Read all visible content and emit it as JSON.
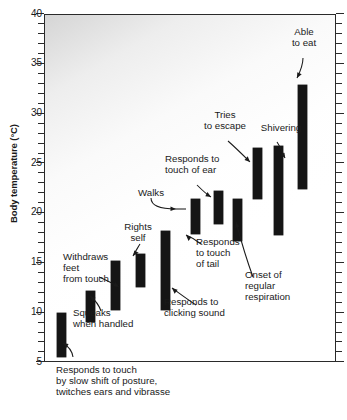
{
  "chart_data": {
    "type": "bar",
    "title": "",
    "xlabel": "",
    "ylabel": "Body temperature (°C)",
    "ylim": [
      3.5,
      40
    ],
    "yticks": [
      5,
      10,
      15,
      20,
      25,
      30,
      35,
      40
    ],
    "ytick_labels": [
      "5",
      "10",
      "15",
      "20",
      "25",
      "30",
      "35",
      "40"
    ],
    "minor_tick_step": 1,
    "grid": false,
    "legend": null,
    "orientation": "vertical",
    "bar_kind": "floating-range",
    "note": "Each black bar is a temperature range over which the behaviour occurs; bars ordered left to right by increasing temperature.",
    "categories": [
      "Responds to touch by slow shift of posture, twitches ears and vibrasse",
      "Squeaks when handled",
      "Withdraws feet from touch",
      "Rights self",
      "Responds to clicking sound",
      "Walks",
      "Responds to touch of ear",
      "Responds to touch of tail",
      "Tries to escape",
      "Onset of regular respiration",
      "Shivering",
      "Able to eat"
    ],
    "bars": [
      {
        "index": 1,
        "x_px": 56,
        "low": 5.6,
        "high": 10.0,
        "label": "Responds to touch by slow shift of posture, twitches ears and vibrasse"
      },
      {
        "index": 2,
        "x_px": 85,
        "low": 9.1,
        "high": 12.2,
        "label": "Squeaks when handled"
      },
      {
        "index": 3,
        "x_px": 110,
        "low": 10.3,
        "high": 15.3,
        "label": "Withdraws feet from touch"
      },
      {
        "index": 4,
        "x_px": 135,
        "low": 12.6,
        "high": 16.0,
        "label": "Rights self"
      },
      {
        "index": 5,
        "x_px": 160,
        "low": 10.3,
        "high": 18.3,
        "label": "Responds to clicking sound"
      },
      {
        "index": 6,
        "x_px": 190,
        "low": 18.0,
        "high": 21.5,
        "label": "Walks"
      },
      {
        "index": 7,
        "x_px": 213,
        "low": 19.0,
        "high": 22.3,
        "label": "Responds to touch of ear"
      },
      {
        "index": 8,
        "x_px": 232,
        "low": 17.3,
        "high": 21.5,
        "label": "Responds to touch of tail"
      },
      {
        "index": 9,
        "x_px": 252,
        "low": 21.5,
        "high": 26.6,
        "label": "Tries to escape"
      },
      {
        "index": 10,
        "x_px": 273,
        "low": 17.9,
        "high": 26.8,
        "label": "Shivering"
      },
      {
        "index": 11,
        "x_px": 297,
        "low": 22.5,
        "high": 33.0,
        "label": "Able to eat"
      }
    ]
  },
  "annotations": {
    "responds_touch_slow": "Responds to touch\nby slow shift of posture,\ntwitches ears and vibrasse",
    "squeaks": "Squeaks\nwhen handled",
    "withdraws": "Withdraws\nfeet\nfrom touch",
    "rights_self": "Rights\nself",
    "responds_clicking": "Responds to\nclicking sound",
    "walks": "Walks",
    "responds_ear": "Responds to\ntouch of ear",
    "responds_tail": "Responds\nto touch\nof  tail",
    "tries_escape": "Tries\nto escape",
    "onset_respiration": "Onset of\nregular\nrespiration",
    "shivering": "Shivering",
    "able_to_eat": "Able\nto eat"
  },
  "axis": {
    "y_title": "Body temperature (°C)",
    "y_tick_labels": [
      "40",
      "35",
      "30",
      "25",
      "20",
      "15",
      "10",
      "5"
    ]
  }
}
